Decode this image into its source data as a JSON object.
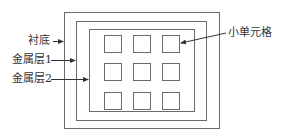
{
  "diagram": {
    "type": "layered-structure-schematic",
    "labels": {
      "substrate": "衬底",
      "metal_layer_1": "金属层1",
      "metal_layer_2": "金属层2",
      "small_cell": "小单元格"
    },
    "colors": {
      "stroke": "#6b6b6b",
      "text": "#333333",
      "background": "#ffffff"
    },
    "layers": [
      {
        "name": "衬底",
        "x": 64,
        "y": 12,
        "w": 155,
        "h": 116
      },
      {
        "name": "金属层1",
        "x": 76,
        "y": 21,
        "w": 130,
        "h": 99
      },
      {
        "name": "金属层2",
        "x": 89,
        "y": 29,
        "w": 105,
        "h": 82
      }
    ],
    "cells": {
      "rows": 3,
      "cols": 3,
      "size": 17,
      "col_x": [
        104,
        133,
        162
      ],
      "row_y": [
        35,
        63,
        92
      ]
    }
  }
}
